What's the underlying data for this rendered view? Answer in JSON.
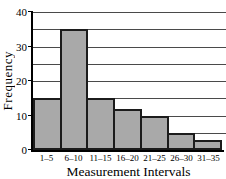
{
  "chart_data": {
    "type": "bar",
    "title": "",
    "xlabel": "Measurement Intervals",
    "ylabel": "Frequency",
    "categories": [
      "1–5",
      "6–10",
      "11–15",
      "16–20",
      "21–25",
      "26–30",
      "31–35"
    ],
    "values": [
      15,
      35,
      15,
      12,
      10,
      5,
      3
    ],
    "ylim": [
      0,
      40
    ],
    "yticks": [
      0,
      10,
      20,
      30,
      40
    ],
    "gridline_step": 5,
    "grid": "horizontal",
    "legend": "none",
    "colors": {
      "bar_fill": "#a9a9a9",
      "bar_border": "#1c1c1c",
      "grid_line": "#4a4a4a",
      "axis": "#000000",
      "background": "#ffffff",
      "text": "#000000"
    }
  }
}
